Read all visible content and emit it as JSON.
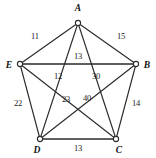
{
  "figure": {
    "background_color": "#ffffff",
    "edge_color": "#2b2b2b",
    "label_color": "#1b1b1b",
    "vertex_fill": "#ffffff"
  },
  "vertices": [
    {
      "id": "A",
      "label": "A",
      "cx": 78,
      "cy": 23,
      "r": 2.6,
      "label_x": 78,
      "label_y": 9
    },
    {
      "id": "B",
      "label": "B",
      "cx": 136,
      "cy": 64,
      "r": 2.6,
      "label_x": 147,
      "label_y": 66
    },
    {
      "id": "C",
      "label": "C",
      "cx": 116,
      "cy": 139,
      "r": 2.6,
      "label_x": 119,
      "label_y": 151
    },
    {
      "id": "D",
      "label": "D",
      "cx": 40,
      "cy": 139,
      "r": 2.6,
      "label_x": 37,
      "label_y": 151
    },
    {
      "id": "E",
      "label": "E",
      "cx": 20,
      "cy": 64,
      "r": 2.6,
      "label_x": 9,
      "label_y": 66
    }
  ],
  "edges": [
    {
      "id": "A-E",
      "from": "A",
      "to": "E",
      "weight": "11",
      "label_x": 35,
      "label_y": 36,
      "thick": false
    },
    {
      "id": "A-B",
      "from": "A",
      "to": "B",
      "weight": "15",
      "label_x": 121,
      "label_y": 36,
      "thick": false
    },
    {
      "id": "E-B",
      "from": "E",
      "to": "B",
      "weight": "13",
      "label_x": 78,
      "label_y": 56,
      "thick": true
    },
    {
      "id": "A-D",
      "from": "A",
      "to": "D",
      "weight": "12",
      "label_x": 58,
      "label_y": 76,
      "thick": false
    },
    {
      "id": "A-C",
      "from": "A",
      "to": "C",
      "weight": "30",
      "label_x": 96,
      "label_y": 76,
      "thick": false
    },
    {
      "id": "E-C",
      "from": "E",
      "to": "C",
      "weight": "23",
      "label_x": 66,
      "label_y": 99,
      "thick": false
    },
    {
      "id": "B-D",
      "from": "B",
      "to": "D",
      "weight": "40",
      "label_x": 87,
      "label_y": 98,
      "thick": false
    },
    {
      "id": "E-D",
      "from": "E",
      "to": "D",
      "weight": "22",
      "label_x": 18,
      "label_y": 103,
      "thick": false
    },
    {
      "id": "B-C",
      "from": "B",
      "to": "C",
      "weight": "14",
      "label_x": 136,
      "label_y": 103,
      "thick": false
    },
    {
      "id": "D-C",
      "from": "D",
      "to": "C",
      "weight": "13",
      "label_x": 78,
      "label_y": 148,
      "thick": true
    }
  ]
}
